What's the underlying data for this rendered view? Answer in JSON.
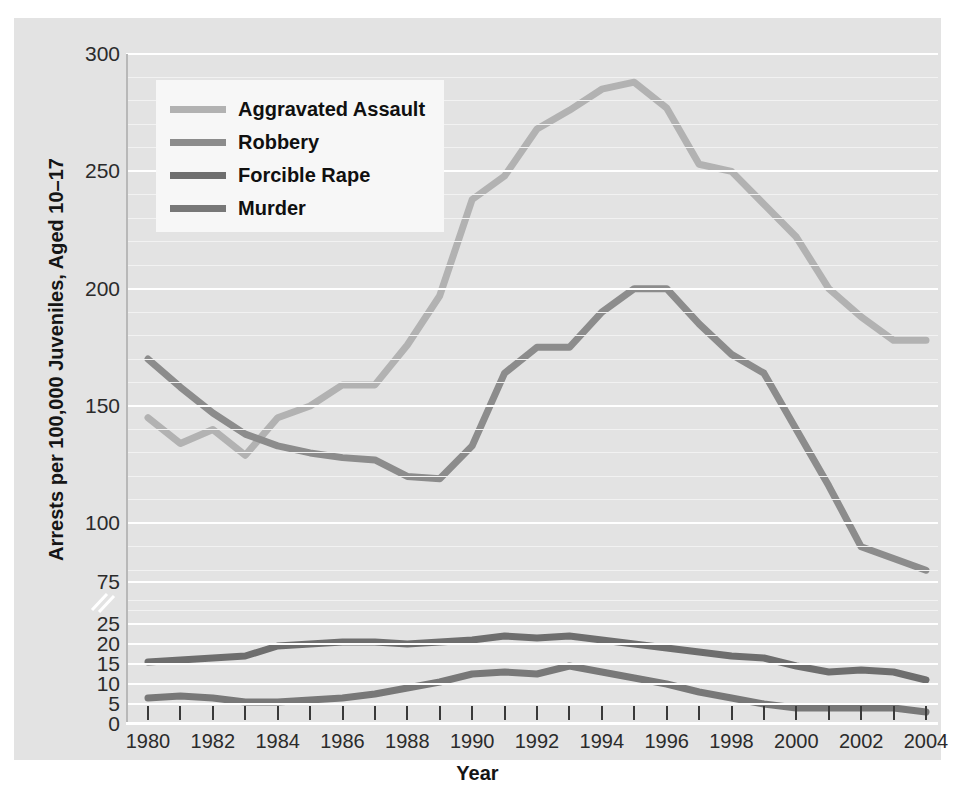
{
  "chart_data": {
    "type": "line",
    "title": "",
    "xlabel": "Year",
    "ylabel": "Arrests per 100,000 Juveniles, Aged 10–17",
    "x": [
      1980,
      1981,
      1982,
      1983,
      1984,
      1985,
      1986,
      1987,
      1988,
      1989,
      1990,
      1991,
      1992,
      1993,
      1994,
      1995,
      1996,
      1997,
      1998,
      1999,
      2000,
      2001,
      2002,
      2003,
      2004
    ],
    "xlim": [
      1980,
      2004
    ],
    "grid": true,
    "legend_position": "top-left",
    "broken_axis": true,
    "upper_panel": {
      "ylim": [
        75,
        300
      ],
      "ticks": [
        75,
        100,
        150,
        200,
        250,
        300
      ]
    },
    "lower_panel": {
      "ylim": [
        0,
        25
      ],
      "ticks": [
        0,
        5,
        10,
        15,
        20,
        25
      ]
    },
    "series": [
      {
        "name": "Aggravated Assault",
        "color": "#b2b2b2",
        "panel": "upper",
        "values": [
          145,
          134,
          140,
          129,
          145,
          150,
          159,
          159,
          176,
          197,
          238,
          248,
          268,
          276,
          285,
          288,
          277,
          253,
          250,
          236,
          222,
          200,
          188,
          178,
          178
        ]
      },
      {
        "name": "Robbery",
        "color": "#8c8c8c",
        "panel": "upper",
        "values": [
          170,
          158,
          147,
          138,
          133,
          130,
          128,
          127,
          120,
          119,
          133,
          164,
          175,
          175,
          190,
          200,
          200,
          185,
          172,
          164,
          140,
          116,
          90,
          85,
          80
        ]
      },
      {
        "name": "Forcible Rape",
        "color": "#6e6e6e",
        "panel": "lower",
        "values": [
          15.5,
          16,
          16.5,
          17,
          19.5,
          20,
          20.5,
          20.5,
          20,
          20.5,
          21,
          22,
          21.5,
          22,
          21,
          20,
          19,
          18,
          17,
          16.5,
          14.5,
          13,
          13.5,
          13,
          11
        ]
      },
      {
        "name": "Murder",
        "color": "#787878",
        "panel": "lower",
        "values": [
          6.5,
          7,
          6.5,
          5.5,
          5.5,
          6,
          6.5,
          7.5,
          9,
          10.5,
          12.5,
          13,
          12.5,
          14.5,
          13,
          11.5,
          10,
          8,
          6.5,
          5,
          4,
          4,
          4,
          4,
          3
        ]
      }
    ],
    "x_tick_labels": [
      "1980",
      "1982",
      "1984",
      "1986",
      "1988",
      "1990",
      "1992",
      "1994",
      "1996",
      "1998",
      "2000",
      "2002",
      "2004"
    ],
    "x_tick_label_years": [
      1980,
      1982,
      1984,
      1986,
      1988,
      1990,
      1992,
      1994,
      1996,
      1998,
      2000,
      2002,
      2004
    ],
    "y_upper_tick_labels": [
      "300",
      "250",
      "200",
      "150",
      "100",
      "75"
    ],
    "y_lower_tick_labels": [
      "25",
      "20",
      "15",
      "10",
      "5",
      "0"
    ]
  },
  "legend": {
    "items": [
      {
        "label": "Aggravated Assault",
        "color": "#b2b2b2"
      },
      {
        "label": "Robbery",
        "color": "#8c8c8c"
      },
      {
        "label": "Forcible Rape",
        "color": "#6e6e6e"
      },
      {
        "label": "Murder",
        "color": "#787878"
      }
    ]
  },
  "axes": {
    "x_title": "Year",
    "y_title": "Arrests per 100,000 Juveniles, Aged 10–17"
  },
  "colors": {
    "background": "#ffffff",
    "panel": "#e3e3e3",
    "gridline": "#ffffff",
    "legend_bg": "#f7f7f7",
    "text": "#151515"
  }
}
